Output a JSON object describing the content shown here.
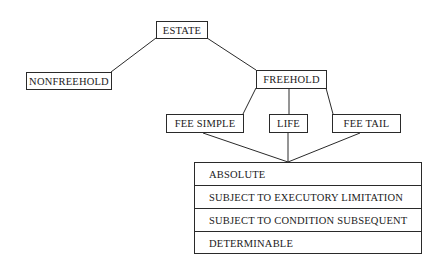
{
  "diagram": {
    "type": "tree",
    "root": "ESTATE",
    "nodes": {
      "estate": "ESTATE",
      "nonfreehold": "NONFREEHOLD",
      "freehold": "FREEHOLD",
      "fee_simple": "FEE SIMPLE",
      "life": "LIFE",
      "fee_tail": "FEE TAIL"
    },
    "subtypes": [
      "ABSOLUTE",
      "SUBJECT TO EXECUTORY LIMITATION",
      "SUBJECT TO CONDITION SUBSEQUENT",
      "DETERMINABLE"
    ],
    "edges": [
      [
        "ESTATE",
        "NONFREEHOLD"
      ],
      [
        "ESTATE",
        "FREEHOLD"
      ],
      [
        "FREEHOLD",
        "FEE SIMPLE"
      ],
      [
        "FREEHOLD",
        "LIFE"
      ],
      [
        "FREEHOLD",
        "FEE TAIL"
      ],
      [
        "FEE SIMPLE",
        "SUBTYPES"
      ],
      [
        "LIFE",
        "SUBTYPES"
      ],
      [
        "FEE TAIL",
        "SUBTYPES"
      ]
    ]
  }
}
